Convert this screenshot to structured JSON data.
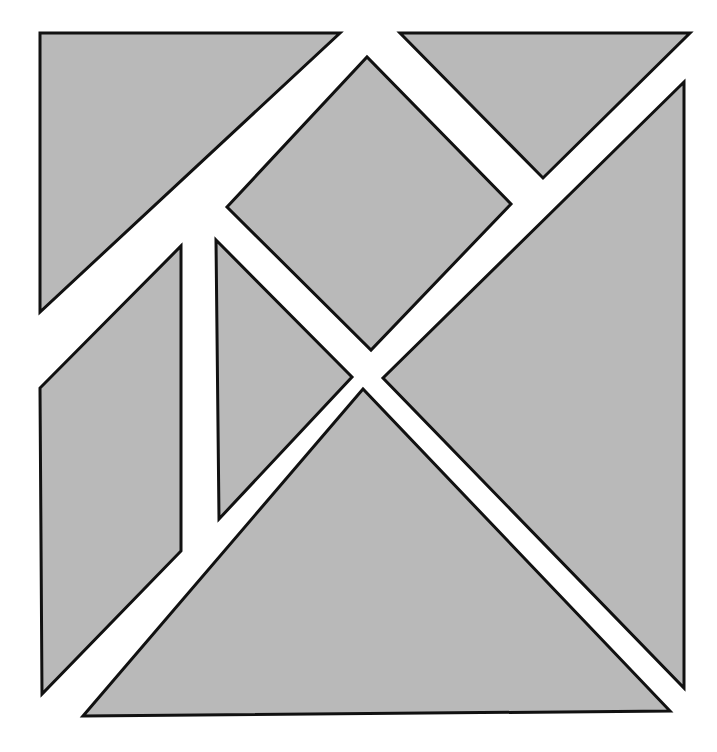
{
  "figure": {
    "kind": "geometric-dissection",
    "canvas_width": 717,
    "canvas_height": 752,
    "background_color": "#ffffff",
    "fill_color": "#b9b9b9",
    "stroke_color": "#111111",
    "stroke_width": 3,
    "piece_count": 7
  },
  "pieces": [
    {
      "id": "large-triangle-top-left",
      "label": "Large right triangle (upper left)",
      "shape": "triangle",
      "fill": "#b9b9b9",
      "stroke": "#111111",
      "stroke_width": 3,
      "points": "40,33 340,33 40,312"
    },
    {
      "id": "medium-triangle-top-right",
      "label": "Medium right triangle (upper right)",
      "shape": "triangle",
      "fill": "#b9b9b9",
      "stroke": "#111111",
      "stroke_width": 3,
      "points": "400,33 690,33 543,178"
    },
    {
      "id": "square-center",
      "label": "Square rotated 45 degrees (center)",
      "shape": "square",
      "fill": "#b9b9b9",
      "stroke": "#111111",
      "stroke_width": 3,
      "points": "227,207 367,57 511,204 371,350"
    },
    {
      "id": "large-triangle-right",
      "label": "Large right triangle (right side)",
      "shape": "triangle",
      "fill": "#b9b9b9",
      "stroke": "#111111",
      "stroke_width": 3,
      "points": "684,82 684,688 383,378"
    },
    {
      "id": "narrow-triangle-center-left",
      "label": "Narrow triangle (center left)",
      "shape": "triangle",
      "fill": "#b9b9b9",
      "stroke": "#111111",
      "stroke_width": 3,
      "points": "216,240 352,377 219,519"
    },
    {
      "id": "parallelogram-left",
      "label": "Parallelogram (left side)",
      "shape": "parallelogram",
      "fill": "#b9b9b9",
      "stroke": "#111111",
      "stroke_width": 3,
      "points": "181,246 181,551 42,694 40,388"
    },
    {
      "id": "large-triangle-bottom",
      "label": "Large right triangle (bottom)",
      "shape": "triangle",
      "fill": "#b9b9b9",
      "stroke": "#111111",
      "stroke_width": 3,
      "points": "83,716 670,711 363,389"
    }
  ]
}
